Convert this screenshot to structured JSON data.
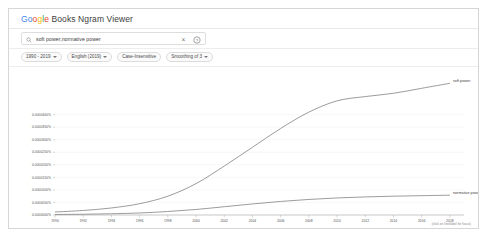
{
  "header": {
    "title_prefix": "Go",
    "title_o1": "o",
    "title_o2": "g",
    "title_l": "l",
    "title_e": "e",
    "title_rest": " Books Ngram Viewer",
    "full_title": "Google Books Ngram Viewer"
  },
  "search": {
    "query": "soft power,normative power",
    "placeholder": "Search in Google Books Ngram Viewer",
    "search_icon": "search-icon",
    "clear_icon": "close-icon",
    "clear_glyph": "×",
    "help_icon": "help-circle-icon",
    "help_glyph": "?"
  },
  "filters": [
    {
      "label": "1990 - 2019",
      "has_caret": true,
      "outlined": true
    },
    {
      "label": "English (2019)",
      "has_caret": true,
      "outlined": true
    },
    {
      "label": "Case-Insensitive",
      "has_caret": false,
      "outlined": true
    },
    {
      "label": "Smoothing of 3",
      "has_caret": true,
      "outlined": true
    }
  ],
  "chart_data": {
    "type": "line",
    "title": "",
    "xlabel": "",
    "ylabel": "",
    "axis_caption": "(click on line/label for focus)",
    "grid": true,
    "legend_position": "inline-right",
    "x": [
      1990,
      1992,
      1994,
      1996,
      1998,
      2000,
      2002,
      2004,
      2006,
      2008,
      2010,
      2012,
      2014,
      2016,
      2018
    ],
    "xtick_labels": [
      "1990",
      "1992",
      "1994",
      "1996",
      "1998",
      "2000",
      "2002",
      "2004",
      "2006",
      "2008",
      "2010",
      "2012",
      "2014",
      "2016",
      "2018"
    ],
    "xlim": [
      1990,
      2019
    ],
    "ytick_labels": [
      "0.0000000%",
      "0.0000050%",
      "0.0000100%",
      "0.0000150%",
      "0.0000200%",
      "0.0000250%",
      "0.0000300%",
      "0.0000350%",
      "0.0000400%"
    ],
    "ytick_values": [
      0,
      5e-09,
      1e-08,
      1.5e-08,
      2e-08,
      2.5e-08,
      3e-08,
      3.5e-08,
      4e-08
    ],
    "ylim": [
      0,
      4e-08
    ],
    "yunit": "%",
    "series": [
      {
        "name": "soft power",
        "color": "#7b7b7b",
        "label_x": 2018.4,
        "values": [
          0.12,
          0.18,
          0.28,
          0.45,
          0.75,
          1.25,
          1.95,
          2.7,
          3.45,
          4.1,
          4.55,
          4.72,
          4.85,
          5.05,
          5.25
        ]
      },
      {
        "name": "normative power",
        "color": "#7b7b7b",
        "label_x": 2018.4,
        "values": [
          0.02,
          0.03,
          0.05,
          0.08,
          0.14,
          0.22,
          0.33,
          0.44,
          0.54,
          0.62,
          0.68,
          0.72,
          0.75,
          0.77,
          0.79
        ]
      }
    ],
    "series_scale_note": "values are in units of 1e-8 percent"
  }
}
